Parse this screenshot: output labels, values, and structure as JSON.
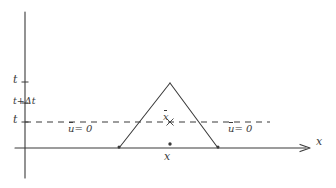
{
  "figure": {
    "background_color": "#ffffff",
    "ink_color": "#3a3a3a",
    "style": "hand-drawn pencil sketch"
  },
  "axes": {
    "vertical": {
      "name": "t-axis",
      "x_px": 25,
      "top_px": 12,
      "bottom_px": 178,
      "has_arrow": false
    },
    "horizontal": {
      "name": "x-axis",
      "label": "x",
      "y_px": 148,
      "left_px": 15,
      "right_px": 310,
      "has_arrow": true
    },
    "tick_labels": [
      {
        "label": "t",
        "y_px": 82,
        "tick": true
      },
      {
        "label": "t+Δt",
        "y_px": 103,
        "tick": true
      },
      {
        "label": "t",
        "y_px": 122,
        "tick": true
      }
    ]
  },
  "dashed_line": {
    "name": "time-level-line",
    "y_px": 122,
    "x_start_px": 25,
    "x_end_px": 270,
    "dash_pattern": "6 5"
  },
  "triangle": {
    "name": "characteristic-triangle",
    "apex": {
      "x_px": 170,
      "y_px": 83
    },
    "base_left": {
      "x_px": 119,
      "y_px": 148
    },
    "base_right": {
      "x_px": 218,
      "y_px": 148
    },
    "filled": false
  },
  "annotations": {
    "u_zero_left": {
      "symbol": "u",
      "overline": true,
      "relation": "= 0",
      "text": "u = 0"
    },
    "u_zero_right": {
      "symbol": "u",
      "overline": true,
      "relation": "= 0",
      "text": "u = 0"
    },
    "x_bar_midpoint": {
      "symbol": "x",
      "overline": true,
      "text": "x"
    },
    "x_base_point": {
      "symbol": "x",
      "text": "x"
    }
  },
  "markers": {
    "base_point_dot": {
      "x_px": 170,
      "y_px": 144
    },
    "midpoint_cross": {
      "x_px": 170,
      "y_px": 122
    },
    "base_left_dot": {
      "x_px": 119,
      "y_px": 148
    },
    "base_right_dot": {
      "x_px": 218,
      "y_px": 148
    }
  }
}
